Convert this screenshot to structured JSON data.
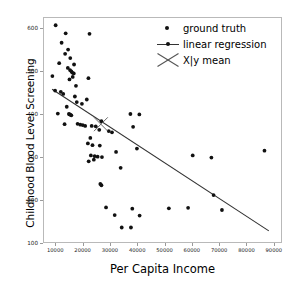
{
  "chart_data": {
    "type": "scatter",
    "title": "",
    "xlabel": "Per Capita Income",
    "ylabel": "Childhood Blood Level Screening",
    "xlim": [
      5500,
      93000
    ],
    "ylim": [
      100,
      625
    ],
    "xticks": [
      10000,
      20000,
      30000,
      40000,
      50000,
      60000,
      70000,
      80000,
      90000
    ],
    "yticks": [
      100,
      200,
      300,
      400,
      500,
      600
    ],
    "grid": false,
    "legend_position": "upper right",
    "legend": [
      {
        "label": "ground truth",
        "marker": "dot",
        "color": "#111111"
      },
      {
        "label": "linear regression",
        "marker": "line-dot",
        "color": "#333333"
      },
      {
        "label": "X|y mean",
        "marker": "x-cross",
        "color": "#555555"
      }
    ],
    "series": [
      {
        "name": "ground truth",
        "marker": "dot",
        "color": "#111111",
        "points": [
          [
            9800,
            608
          ],
          [
            13500,
            589
          ],
          [
            22300,
            588
          ],
          [
            12000,
            567
          ],
          [
            14400,
            551
          ],
          [
            13300,
            541
          ],
          [
            15200,
            531
          ],
          [
            11100,
            519
          ],
          [
            16600,
            516
          ],
          [
            14300,
            508
          ],
          [
            15100,
            503
          ],
          [
            15600,
            500
          ],
          [
            15900,
            497
          ],
          [
            16500,
            495
          ],
          [
            8600,
            489
          ],
          [
            16100,
            487
          ],
          [
            21900,
            484
          ],
          [
            14900,
            481
          ],
          [
            17300,
            466
          ],
          [
            9600,
            455
          ],
          [
            11700,
            452
          ],
          [
            12600,
            447
          ],
          [
            16900,
            441
          ],
          [
            21300,
            434
          ],
          [
            17600,
            428
          ],
          [
            19500,
            424
          ],
          [
            13900,
            417
          ],
          [
            10600,
            401
          ],
          [
            14700,
            400
          ],
          [
            15000,
            399
          ],
          [
            15300,
            398
          ],
          [
            15600,
            397
          ],
          [
            37400,
            400
          ],
          [
            40700,
            399
          ],
          [
            13100,
            376
          ],
          [
            17900,
            377
          ],
          [
            18900,
            375
          ],
          [
            19800,
            374
          ],
          [
            20700,
            372
          ],
          [
            23100,
            372
          ],
          [
            24600,
            371
          ],
          [
            26700,
            383
          ],
          [
            38400,
            370
          ],
          [
            25900,
            363
          ],
          [
            29400,
            360
          ],
          [
            30600,
            357
          ],
          [
            22600,
            344
          ],
          [
            39800,
            319
          ],
          [
            21700,
            331
          ],
          [
            23400,
            327
          ],
          [
            26100,
            326
          ],
          [
            32100,
            311
          ],
          [
            60400,
            303
          ],
          [
            67300,
            298
          ],
          [
            86900,
            314
          ],
          [
            22800,
            303
          ],
          [
            24200,
            301
          ],
          [
            25300,
            300
          ],
          [
            23900,
            293
          ],
          [
            22000,
            289
          ],
          [
            26900,
            299
          ],
          [
            33800,
            274
          ],
          [
            26300,
            236
          ],
          [
            26700,
            233
          ],
          [
            68100,
            210
          ],
          [
            58700,
            180
          ],
          [
            51600,
            179
          ],
          [
            28400,
            181
          ],
          [
            38100,
            178
          ],
          [
            71200,
            175
          ],
          [
            31600,
            163
          ],
          [
            40800,
            162
          ],
          [
            34200,
            134
          ],
          [
            37600,
            134
          ]
        ]
      }
    ],
    "regression_line": {
      "name": "linear regression",
      "color": "#333333",
      "x_start": 8500,
      "y_start": 458,
      "x_end": 88500,
      "y_end": 126
    },
    "mean_marker": {
      "name": "X|y mean",
      "color": "#555555",
      "x": 26500,
      "y": 376
    }
  }
}
